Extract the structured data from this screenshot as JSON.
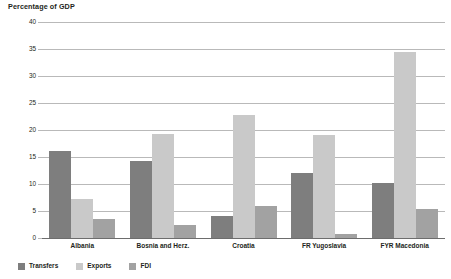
{
  "chart_data": {
    "type": "bar",
    "title": "Percentage of GDP",
    "xlabel": "",
    "ylabel": "",
    "ylim": [
      0,
      40
    ],
    "yticks": [
      0,
      5,
      10,
      15,
      20,
      25,
      30,
      35,
      40
    ],
    "ytick_labels": [
      "0",
      "5",
      "10",
      "15",
      "20",
      "25",
      "30",
      "35",
      "40"
    ],
    "grid": true,
    "legend_position": "bottom-left",
    "categories": [
      "Albania",
      "Bosnia and Herz.",
      "Croatia",
      "FR Yugoslavia",
      "FYR Macedonia"
    ],
    "series": [
      {
        "name": "Transfers",
        "color": "#7e7e7e",
        "values": [
          16.2,
          14.2,
          4.0,
          12.0,
          10.2
        ]
      },
      {
        "name": "Exports",
        "color": "#c9c9c9",
        "values": [
          7.2,
          19.2,
          22.8,
          19.0,
          34.5
        ]
      },
      {
        "name": "FDI",
        "color": "#a2a2a2",
        "values": [
          3.5,
          2.5,
          6.0,
          0.8,
          5.4
        ]
      }
    ]
  },
  "axis": {
    "gridline_color": "#b9b9b9",
    "zero_line_color": "#6d6d6d"
  }
}
